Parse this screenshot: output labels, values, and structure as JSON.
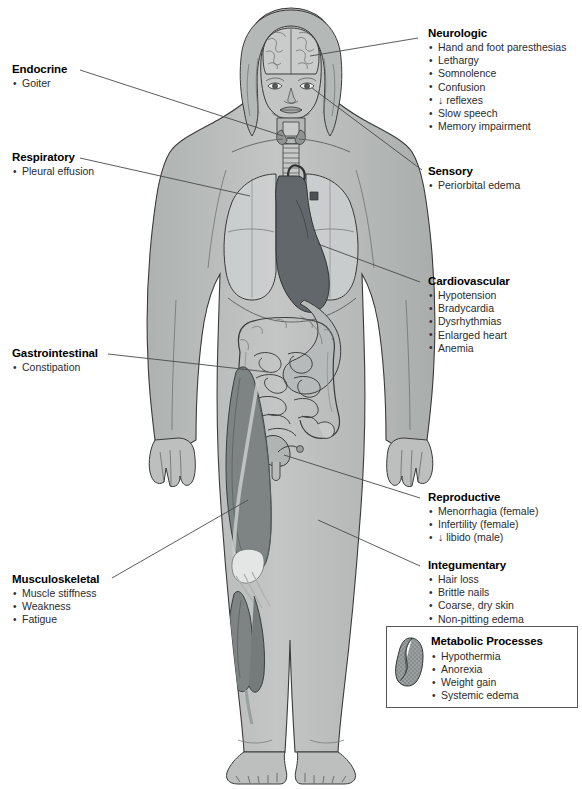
{
  "document": {
    "type": "anatomical-illustration",
    "subject": "Multisystem clinical manifestations shown on a full-body female figure",
    "figure_description": "Anterior view of a standing female figure with cutaway views revealing the brain, thyroid and trachea, lungs, heart, stomach, small and large intestine, uterus, and the musculature of the left leg"
  },
  "callouts": {
    "neurologic": {
      "title": "Neurologic",
      "items": [
        "Hand and foot paresthesias",
        "Lethargy",
        "Somnolence",
        "Confusion",
        "↓ reflexes",
        "Slow speech",
        "Memory impairment"
      ]
    },
    "endocrine": {
      "title": "Endocrine",
      "items": [
        "Goiter"
      ]
    },
    "respiratory": {
      "title": "Respiratory",
      "items": [
        "Pleural effusion"
      ]
    },
    "sensory": {
      "title": "Sensory",
      "items": [
        "Periorbital edema"
      ]
    },
    "cardiovascular": {
      "title": "Cardiovascular",
      "items": [
        "Hypotension",
        "Bradycardia",
        "Dysrhythmias",
        "Enlarged heart",
        "Anemia"
      ]
    },
    "gastrointestinal": {
      "title": "Gastrointestinal",
      "items": [
        "Constipation"
      ]
    },
    "reproductive": {
      "title": "Reproductive",
      "items": [
        "Menorrhagia (female)",
        "Infertility (female)",
        "↓ libido (male)"
      ]
    },
    "integumentary": {
      "title": "Integumentary",
      "items": [
        "Hair loss",
        "Brittle nails",
        "Coarse, dry skin",
        "Non-pitting edema"
      ]
    },
    "musculoskeletal": {
      "title": "Musculoskeletal",
      "items": [
        "Muscle stiffness",
        "Weakness",
        "Fatigue"
      ]
    },
    "metabolic": {
      "title": "Metabolic Processes",
      "icon": "kidney-organ-icon",
      "items": [
        "Hypothermia",
        "Anorexia",
        "Weight gain",
        "Systemic edema"
      ]
    }
  },
  "colors": {
    "background": "#ffffff",
    "skin_fill": "#b9bcbb",
    "skin_shadow": "#a6aaa9",
    "organ_light": "#cfd2d1",
    "organ_mid": "#9fa3a3",
    "organ_dark": "#6d7272",
    "heart_dark": "#5b6161",
    "muscle_fill": "#7f8584",
    "outline": "#3a3a3a",
    "leader_line": "#4a4a4a",
    "text": "#2b2b2b",
    "title_text": "#000000",
    "box_border": "#555555"
  }
}
